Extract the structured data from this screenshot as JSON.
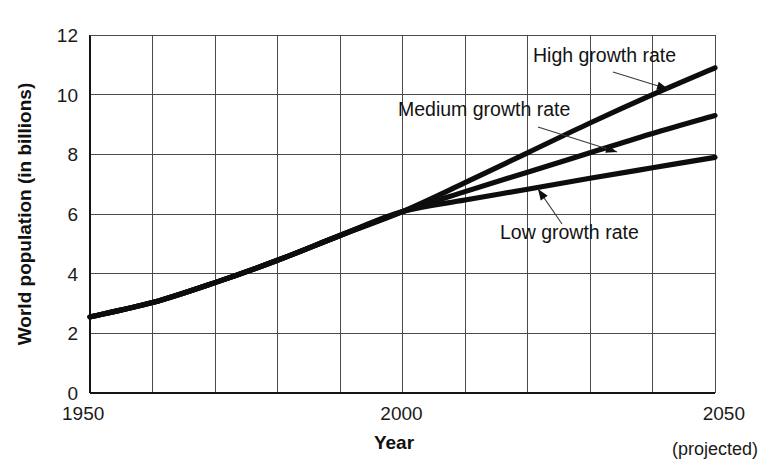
{
  "figure": {
    "title_fragment": "",
    "background": "#ffffff"
  },
  "chart_data": {
    "type": "line",
    "title": "",
    "xlabel": "Year",
    "ylabel": "World population (in billions)",
    "xlim": [
      1950,
      2050
    ],
    "ylim": [
      0,
      12
    ],
    "grid": true,
    "grid_x_step": 10,
    "grid_y_step": 2,
    "legend_position": "inline-annotations",
    "x_ticks": [
      1950,
      2000,
      2050
    ],
    "x_tick_labels": [
      "1950",
      "2000",
      "2050"
    ],
    "x_tick_note": "(projected)",
    "y_ticks": [
      0,
      2,
      4,
      6,
      8,
      10,
      12
    ],
    "y_tick_labels": [
      "0",
      "2",
      "4",
      "6",
      "8",
      "10",
      "12"
    ],
    "series": [
      {
        "name": "High growth rate",
        "x": [
          1950,
          1960,
          1970,
          1980,
          1990,
          2000,
          2010,
          2020,
          2030,
          2040,
          2050
        ],
        "values": [
          2.55,
          3.03,
          3.7,
          4.45,
          5.28,
          6.08,
          7.05,
          8.05,
          9.05,
          10.0,
          10.9
        ]
      },
      {
        "name": "Medium growth rate",
        "x": [
          1950,
          1960,
          1970,
          1980,
          1990,
          2000,
          2010,
          2020,
          2030,
          2040,
          2050
        ],
        "values": [
          2.55,
          3.03,
          3.7,
          4.45,
          5.28,
          6.08,
          6.75,
          7.4,
          8.05,
          8.7,
          9.3
        ]
      },
      {
        "name": "Low growth rate",
        "x": [
          1950,
          1960,
          1970,
          1980,
          1990,
          2000,
          2010,
          2020,
          2030,
          2040,
          2050
        ],
        "values": [
          2.55,
          3.03,
          3.7,
          4.45,
          5.28,
          6.08,
          6.47,
          6.83,
          7.2,
          7.55,
          7.9
        ]
      }
    ],
    "annotations": [
      {
        "label": "High growth rate",
        "text_x": 533,
        "text_y": 62,
        "leader_from_x": 613,
        "leader_from_y": 72,
        "leader_to_x": 668,
        "leader_to_y": 89
      },
      {
        "label": "Medium growth rate",
        "text_x": 398,
        "text_y": 116,
        "leader_from_x": 538,
        "leader_from_y": 127,
        "leader_to_x": 617,
        "leader_to_y": 152
      },
      {
        "label": "Low growth rate",
        "text_x": 500,
        "text_y": 239,
        "leader_from_x": 562,
        "leader_from_y": 224,
        "leader_to_x": 538,
        "leader_to_y": 189
      }
    ]
  }
}
